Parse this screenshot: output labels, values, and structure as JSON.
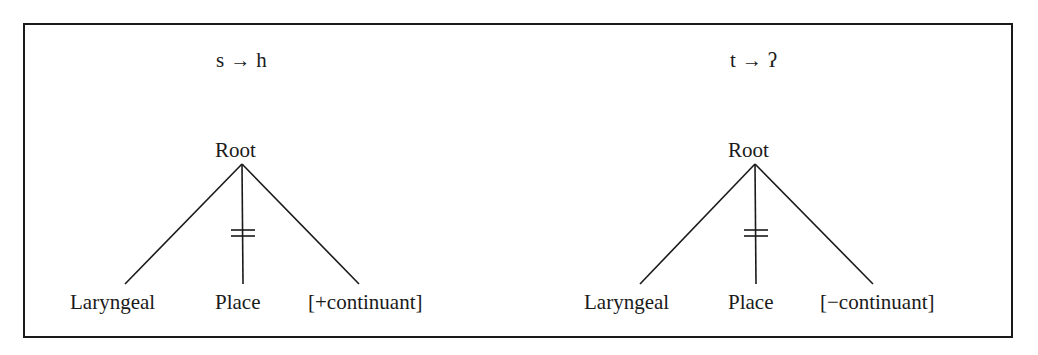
{
  "panels": [
    {
      "rule": {
        "from": "s",
        "arrow": "→",
        "to": "h"
      },
      "root": "Root",
      "children": [
        "Laryngeal",
        "Place",
        "[+continuant]"
      ],
      "delinked": "Place"
    },
    {
      "rule": {
        "from": "t",
        "arrow": "→",
        "to": "ʔ"
      },
      "root": "Root",
      "children": [
        "Laryngeal",
        "Place",
        "[−continuant]"
      ],
      "delinked": "Place"
    }
  ],
  "colors": {
    "ink": "#1a1a1a",
    "background": "#ffffff"
  }
}
